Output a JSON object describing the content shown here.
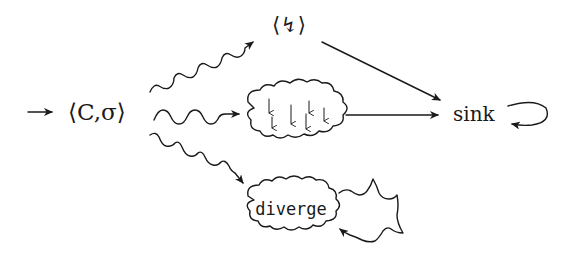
{
  "diagram": {
    "nodes": {
      "start": {
        "label": "⟨C,σ⟩"
      },
      "error": {
        "label": "⟨↯⟩"
      },
      "cloud_label": "",
      "sink": {
        "label": "sink"
      },
      "diverge": {
        "label": "diverge"
      }
    },
    "edges": [
      {
        "from": "entry",
        "to": "start",
        "style": "straight-arrow"
      },
      {
        "from": "start",
        "to": "error",
        "style": "wavy-arrow"
      },
      {
        "from": "start",
        "to": "cloud",
        "style": "wavy-arrow"
      },
      {
        "from": "start",
        "to": "diverge",
        "style": "wavy-arrow"
      },
      {
        "from": "error",
        "to": "sink",
        "style": "straight-arrow"
      },
      {
        "from": "cloud",
        "to": "sink",
        "style": "straight-arrow"
      },
      {
        "from": "sink",
        "to": "sink",
        "style": "self-loop"
      },
      {
        "from": "diverge",
        "to": "diverge",
        "style": "wavy-self-loop"
      }
    ],
    "cloud_contents": "downward arrows"
  }
}
